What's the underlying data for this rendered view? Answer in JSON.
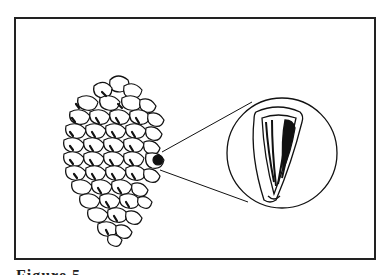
{
  "figure": {
    "caption_partial": "Figure 5",
    "colors": {
      "ink": "#111111",
      "background": "#ffffff",
      "frame": "#222222"
    },
    "elements": {
      "pinecone": "pinecone-illustration",
      "magnifier": "magnified-seed-circle",
      "seed": "seed-illustration"
    }
  }
}
